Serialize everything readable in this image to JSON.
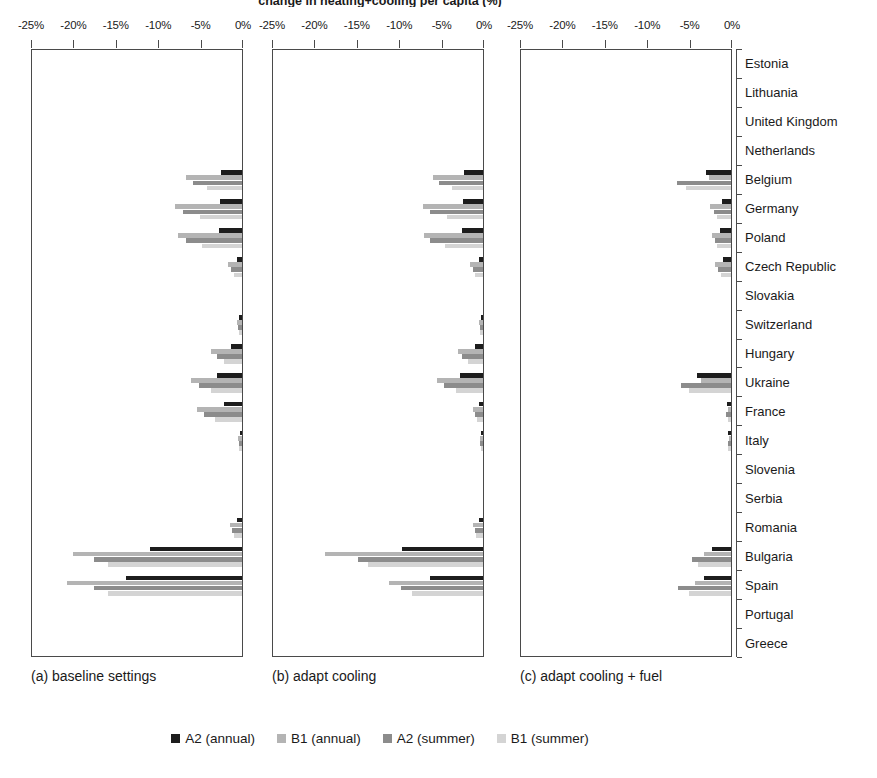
{
  "figure": {
    "title": "change in heating+cooling per capita (%)",
    "panels": [
      {
        "id": "a",
        "caption": "(a) baseline settings"
      },
      {
        "id": "b",
        "caption": "(b) adapt cooling"
      },
      {
        "id": "c",
        "caption": "(c) adapt cooling + fuel"
      }
    ]
  },
  "legend": {
    "position": "bottom",
    "entries": [
      {
        "label": "A2 (annual)",
        "color": "#1d1d1d"
      },
      {
        "label": "B1 (annual)",
        "color": "#b4b4b4"
      },
      {
        "label": "A2 (summer)",
        "color": "#8c8c8c"
      },
      {
        "label": "B1 (summer)",
        "color": "#d4d4d4"
      }
    ]
  },
  "chart_data": {
    "type": "bar",
    "orientation": "horizontal",
    "title": "change in heating+cooling per capita (%)",
    "xlabel": "",
    "ylabel": "",
    "xlim": [
      -25,
      0
    ],
    "xticks": [
      -25,
      -20,
      -15,
      -10,
      -5,
      0
    ],
    "xticklabels": [
      "-25%",
      "-20%",
      "-15%",
      "-10%",
      "-5%",
      "0%"
    ],
    "grid": false,
    "legend_position": "bottom",
    "categories": [
      "Estonia",
      "Lithuania",
      "United Kingdom",
      "Netherlands",
      "Belgium",
      "Germany",
      "Poland",
      "Czech Republic",
      "Slovakia",
      "Switzerland",
      "Hungary",
      "Ukraine",
      "France",
      "Italy",
      "Slovenia",
      "Serbia",
      "Romania",
      "Bulgaria",
      "Spain",
      "Portugal",
      "Greece"
    ],
    "series_names": [
      "A2 (annual)",
      "B1 (annual)",
      "A2 (summer)",
      "B1 (summer)"
    ],
    "panels": [
      {
        "id": "a",
        "caption": "(a) baseline settings",
        "series": [
          {
            "name": "A2 (annual)",
            "color": "#1d1d1d",
            "values": [
              0,
              0,
              0,
              0,
              -2.5,
              -2.6,
              -2.7,
              -0.6,
              0,
              -0.3,
              -1.3,
              -3.0,
              -2.1,
              -0.2,
              0,
              0,
              -0.6,
              -10.8,
              -13.7,
              0,
              0
            ]
          },
          {
            "name": "B1 (annual)",
            "color": "#b4b4b4",
            "values": [
              0,
              0,
              0,
              0,
              -6.6,
              -7.9,
              -7.6,
              -1.6,
              0,
              -0.6,
              -3.6,
              -6.0,
              -5.3,
              -0.5,
              0,
              0,
              -1.4,
              -19.9,
              -20.6,
              0,
              0
            ]
          },
          {
            "name": "A2 (summer)",
            "color": "#8c8c8c",
            "values": [
              0,
              0,
              0,
              0,
              -5.8,
              -7.0,
              -6.6,
              -1.3,
              0,
              -0.5,
              -3.0,
              -5.1,
              -4.5,
              -0.4,
              0,
              0,
              -1.2,
              -17.5,
              -17.4,
              0,
              0
            ]
          },
          {
            "name": "B1 (summer)",
            "color": "#d4d4d4",
            "values": [
              0,
              0,
              0,
              0,
              -4.1,
              -4.9,
              -4.7,
              -0.9,
              0,
              -0.4,
              -2.1,
              -3.6,
              -3.2,
              -0.3,
              0,
              0,
              -0.9,
              -15.8,
              -15.8,
              0,
              0
            ]
          }
        ]
      },
      {
        "id": "b",
        "caption": "(b) adapt cooling",
        "series": [
          {
            "name": "A2 (annual)",
            "color": "#1d1d1d",
            "values": [
              0,
              0,
              0,
              0,
              -2.2,
              -2.4,
              -2.5,
              -0.5,
              0,
              -0.2,
              -1.0,
              -2.7,
              -0.5,
              -0.2,
              0,
              0,
              -0.5,
              -9.6,
              -6.2,
              0,
              0
            ]
          },
          {
            "name": "B1 (annual)",
            "color": "#b4b4b4",
            "values": [
              0,
              0,
              0,
              0,
              -5.9,
              -7.1,
              -7.0,
              -1.5,
              0,
              -0.5,
              -3.0,
              -5.4,
              -1.2,
              -0.4,
              0,
              0,
              -1.2,
              -18.6,
              -11.1,
              0,
              0
            ]
          },
          {
            "name": "A2 (summer)",
            "color": "#8c8c8c",
            "values": [
              0,
              0,
              0,
              0,
              -5.2,
              -6.3,
              -6.2,
              -1.2,
              0,
              -0.4,
              -2.5,
              -4.6,
              -1.0,
              -0.3,
              0,
              0,
              -1.0,
              -14.8,
              -9.7,
              0,
              0
            ]
          },
          {
            "name": "B1 (summer)",
            "color": "#d4d4d4",
            "values": [
              0,
              0,
              0,
              0,
              -3.6,
              -4.3,
              -4.5,
              -0.9,
              0,
              -0.3,
              -1.8,
              -3.2,
              -0.7,
              -0.2,
              0,
              0,
              -0.8,
              -13.6,
              -8.4,
              0,
              0
            ]
          }
        ]
      },
      {
        "id": "c",
        "caption": "(c) adapt cooling + fuel",
        "series": [
          {
            "name": "A2 (annual)",
            "color": "#1d1d1d",
            "values": [
              0,
              0,
              0,
              0,
              -3.0,
              -1.1,
              -1.3,
              -1.0,
              0,
              0,
              0,
              -4.0,
              -0.5,
              -0.3,
              0,
              0,
              0,
              -2.2,
              -3.2,
              0,
              0
            ]
          },
          {
            "name": "B1 (annual)",
            "color": "#b4b4b4",
            "values": [
              0,
              0,
              0,
              0,
              -2.6,
              -2.5,
              -2.3,
              -1.9,
              0,
              0,
              0,
              -3.5,
              -0.4,
              -0.2,
              0,
              0,
              0,
              -3.2,
              -4.3,
              0,
              0
            ]
          },
          {
            "name": "A2 (summer)",
            "color": "#8c8c8c",
            "values": [
              0,
              0,
              0,
              0,
              -6.4,
              -2.0,
              -1.9,
              -1.5,
              0,
              0,
              0,
              -5.9,
              -0.6,
              -0.4,
              0,
              0,
              0,
              -4.6,
              -6.2,
              0,
              0
            ]
          },
          {
            "name": "B1 (summer)",
            "color": "#d4d4d4",
            "values": [
              0,
              0,
              0,
              0,
              -5.3,
              -1.6,
              -1.6,
              -1.2,
              0,
              0,
              0,
              -5.0,
              -0.4,
              -0.3,
              0,
              0,
              0,
              -3.9,
              -4.9,
              0,
              0
            ]
          }
        ]
      }
    ]
  }
}
